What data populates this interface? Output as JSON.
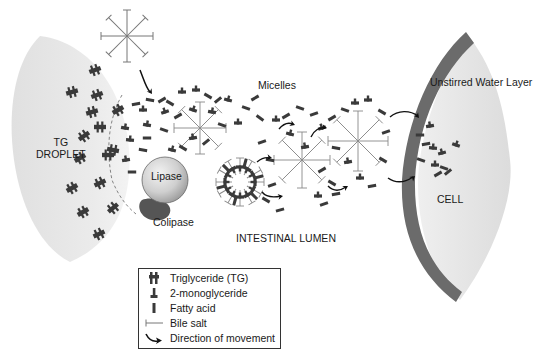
{
  "diagram": {
    "type": "biological-process",
    "colors": {
      "droplet_fill": "#e6e6e6",
      "cell_fill": "#e3e3e3",
      "membrane": "#6b6b6b",
      "molecule": "#3a3a3a",
      "bile_salt": "#777777",
      "lipase_fill": "#c8c8c8",
      "colipase_fill": "#555555",
      "text": "#1a1a1a"
    }
  },
  "labels": {
    "droplet_line1": "TG",
    "droplet_line2": "DROPLET",
    "lipase": "Lipase",
    "colipase": "Colipase",
    "micelles": "Micelles",
    "lumen": "INTESTINAL LUMEN",
    "water_layer": "Unstirred Water Layer",
    "cell": "CELL"
  },
  "legend": {
    "items": [
      {
        "icon": "triglyceride-icon",
        "label": "Triglyceride (TG)"
      },
      {
        "icon": "monoglyceride-icon",
        "label": "2-monoglyceride"
      },
      {
        "icon": "fatty-acid-icon",
        "label": "Fatty acid"
      },
      {
        "icon": "bile-salt-icon",
        "label": "Bile salt"
      },
      {
        "icon": "arrow-icon",
        "label": "Direction of movement"
      }
    ]
  }
}
